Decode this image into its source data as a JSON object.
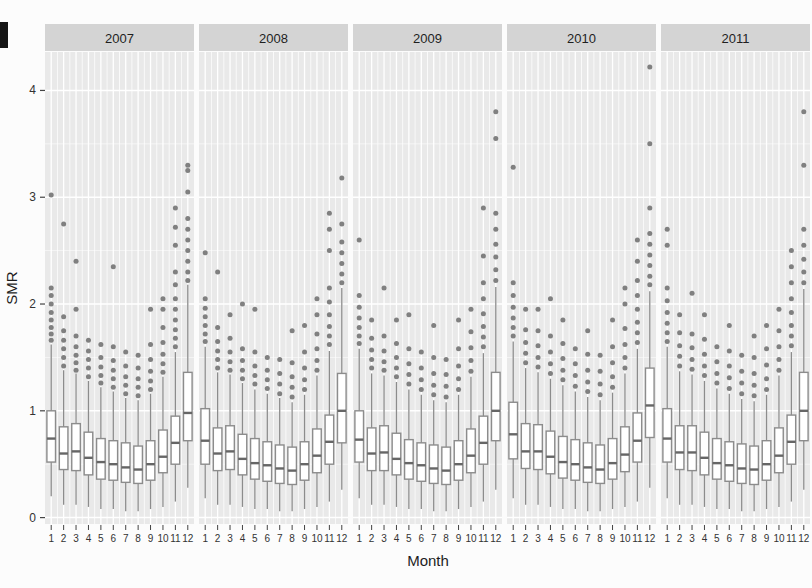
{
  "chart_data": {
    "type": "boxplot",
    "title": "",
    "facets": [
      "2007",
      "2008",
      "2009",
      "2010",
      "2011"
    ],
    "xlabel": "Month",
    "ylabel": "SMR",
    "x_categories": [
      "1",
      "2",
      "3",
      "4",
      "5",
      "6",
      "7",
      "8",
      "9",
      "10",
      "11",
      "12"
    ],
    "yticks": [
      0,
      1,
      2,
      3,
      4
    ],
    "ylim": [
      -0.06,
      4.36
    ],
    "legend": "none",
    "grid": "white major and minor gridlines on gray panels",
    "box_value_order": [
      "whisker_low",
      "q1",
      "median",
      "q3",
      "whisker_high",
      "outliers"
    ],
    "panels": [
      {
        "year": "2007",
        "boxes": [
          [
            0.2,
            0.52,
            0.74,
            1.0,
            1.62,
            [
              1.66,
              1.72,
              1.78,
              1.85,
              1.92,
              2.0,
              2.08,
              2.15,
              3.02
            ]
          ],
          [
            0.12,
            0.45,
            0.6,
            0.85,
            1.38,
            [
              1.42,
              1.5,
              1.58,
              1.66,
              1.75,
              1.88,
              2.75
            ]
          ],
          [
            0.12,
            0.44,
            0.62,
            0.88,
            1.35,
            [
              1.38,
              1.45,
              1.52,
              1.6,
              1.7,
              1.95,
              2.4
            ]
          ],
          [
            0.1,
            0.4,
            0.56,
            0.8,
            1.28,
            [
              1.32,
              1.4,
              1.48,
              1.56,
              1.66
            ]
          ],
          [
            0.08,
            0.36,
            0.52,
            0.74,
            1.22,
            [
              1.26,
              1.33,
              1.41,
              1.5,
              1.62
            ]
          ],
          [
            0.08,
            0.35,
            0.5,
            0.72,
            1.18,
            [
              1.22,
              1.3,
              1.38,
              1.47,
              1.6,
              2.35
            ]
          ],
          [
            0.06,
            0.33,
            0.47,
            0.7,
            1.12,
            [
              1.16,
              1.24,
              1.32,
              1.42,
              1.55
            ]
          ],
          [
            0.06,
            0.32,
            0.45,
            0.67,
            1.1,
            [
              1.14,
              1.22,
              1.3,
              1.4,
              1.52
            ]
          ],
          [
            0.08,
            0.35,
            0.5,
            0.72,
            1.16,
            [
              1.2,
              1.28,
              1.37,
              1.48,
              1.62,
              1.95
            ]
          ],
          [
            0.1,
            0.42,
            0.57,
            0.82,
            1.32,
            [
              1.36,
              1.44,
              1.53,
              1.64,
              1.78,
              1.95,
              2.05
            ]
          ],
          [
            0.15,
            0.5,
            0.7,
            0.95,
            1.55,
            [
              1.6,
              1.68,
              1.76,
              1.85,
              1.95,
              2.05,
              2.18,
              2.3,
              2.55,
              2.72,
              2.9
            ]
          ],
          [
            0.28,
            0.72,
            0.98,
            1.36,
            2.18,
            [
              2.22,
              2.3,
              2.4,
              2.5,
              2.6,
              2.7,
              2.8,
              3.05,
              3.25,
              3.3
            ]
          ]
        ]
      },
      {
        "year": "2008",
        "boxes": [
          [
            0.18,
            0.5,
            0.72,
            1.02,
            1.6,
            [
              1.65,
              1.72,
              1.8,
              1.88,
              1.96,
              2.05,
              2.48
            ]
          ],
          [
            0.12,
            0.44,
            0.6,
            0.84,
            1.36,
            [
              1.4,
              1.48,
              1.56,
              1.65,
              1.78,
              2.3
            ]
          ],
          [
            0.12,
            0.45,
            0.62,
            0.86,
            1.34,
            [
              1.38,
              1.46,
              1.55,
              1.68,
              1.9
            ]
          ],
          [
            0.1,
            0.4,
            0.55,
            0.78,
            1.26,
            [
              1.3,
              1.38,
              1.47,
              1.58,
              2.0
            ]
          ],
          [
            0.08,
            0.36,
            0.51,
            0.74,
            1.2,
            [
              1.25,
              1.33,
              1.42,
              1.55,
              1.95
            ]
          ],
          [
            0.08,
            0.34,
            0.49,
            0.71,
            1.16,
            [
              1.21,
              1.29,
              1.38,
              1.5
            ]
          ],
          [
            0.06,
            0.32,
            0.46,
            0.68,
            1.12,
            [
              1.16,
              1.25,
              1.35,
              1.48
            ]
          ],
          [
            0.06,
            0.31,
            0.44,
            0.66,
            1.08,
            [
              1.13,
              1.22,
              1.32,
              1.45,
              1.75
            ]
          ],
          [
            0.08,
            0.35,
            0.5,
            0.71,
            1.15,
            [
              1.2,
              1.29,
              1.4,
              1.55,
              1.8
            ]
          ],
          [
            0.1,
            0.42,
            0.58,
            0.83,
            1.33,
            [
              1.38,
              1.47,
              1.58,
              1.72,
              1.9,
              2.05
            ]
          ],
          [
            0.15,
            0.5,
            0.71,
            0.96,
            1.56,
            [
              1.62,
              1.7,
              1.79,
              1.9,
              2.02,
              2.15,
              2.5,
              2.7,
              2.85
            ]
          ],
          [
            0.26,
            0.7,
            1.0,
            1.35,
            2.15,
            [
              2.2,
              2.28,
              2.38,
              2.48,
              2.58,
              2.75,
              3.18
            ]
          ]
        ]
      },
      {
        "year": "2009",
        "boxes": [
          [
            0.18,
            0.52,
            0.73,
            1.0,
            1.58,
            [
              1.63,
              1.7,
              1.78,
              1.87,
              1.97,
              2.08,
              2.6
            ]
          ],
          [
            0.12,
            0.44,
            0.6,
            0.84,
            1.35,
            [
              1.4,
              1.48,
              1.57,
              1.68,
              1.85
            ]
          ],
          [
            0.12,
            0.44,
            0.61,
            0.86,
            1.33,
            [
              1.38,
              1.46,
              1.56,
              1.7,
              2.15
            ]
          ],
          [
            0.1,
            0.4,
            0.55,
            0.79,
            1.27,
            [
              1.32,
              1.4,
              1.5,
              1.63,
              1.85
            ]
          ],
          [
            0.08,
            0.36,
            0.51,
            0.73,
            1.2,
            [
              1.25,
              1.34,
              1.44,
              1.58,
              1.9
            ]
          ],
          [
            0.08,
            0.34,
            0.49,
            0.7,
            1.15,
            [
              1.2,
              1.29,
              1.4,
              1.55
            ]
          ],
          [
            0.06,
            0.32,
            0.46,
            0.68,
            1.1,
            [
              1.15,
              1.24,
              1.35,
              1.5,
              1.8
            ]
          ],
          [
            0.06,
            0.31,
            0.44,
            0.66,
            1.08,
            [
              1.13,
              1.23,
              1.34,
              1.48
            ]
          ],
          [
            0.08,
            0.35,
            0.5,
            0.72,
            1.15,
            [
              1.2,
              1.3,
              1.42,
              1.58,
              1.85
            ]
          ],
          [
            0.1,
            0.42,
            0.58,
            0.83,
            1.32,
            [
              1.37,
              1.47,
              1.59,
              1.74,
              1.95
            ]
          ],
          [
            0.15,
            0.5,
            0.7,
            0.95,
            1.54,
            [
              1.6,
              1.69,
              1.79,
              1.91,
              2.05,
              2.2,
              2.45,
              2.9
            ]
          ],
          [
            0.26,
            0.72,
            1.0,
            1.36,
            2.16,
            [
              2.22,
              2.32,
              2.44,
              2.56,
              2.7,
              2.85,
              3.55,
              3.8
            ]
          ]
        ]
      },
      {
        "year": "2010",
        "boxes": [
          [
            0.18,
            0.55,
            0.78,
            1.08,
            1.65,
            [
              1.7,
              1.78,
              1.87,
              1.97,
              2.08,
              2.2,
              3.28
            ]
          ],
          [
            0.12,
            0.46,
            0.62,
            0.88,
            1.4,
            [
              1.45,
              1.54,
              1.64,
              1.76,
              1.95
            ]
          ],
          [
            0.12,
            0.45,
            0.62,
            0.87,
            1.36,
            [
              1.41,
              1.5,
              1.61,
              1.75,
              1.95
            ]
          ],
          [
            0.1,
            0.41,
            0.57,
            0.81,
            1.3,
            [
              1.35,
              1.44,
              1.55,
              1.7,
              2.05
            ]
          ],
          [
            0.08,
            0.37,
            0.52,
            0.76,
            1.24,
            [
              1.29,
              1.38,
              1.49,
              1.63,
              1.85
            ]
          ],
          [
            0.08,
            0.35,
            0.5,
            0.73,
            1.18,
            [
              1.23,
              1.33,
              1.44,
              1.58
            ]
          ],
          [
            0.06,
            0.33,
            0.47,
            0.7,
            1.13,
            [
              1.18,
              1.27,
              1.38,
              1.53,
              1.75
            ]
          ],
          [
            0.06,
            0.32,
            0.45,
            0.68,
            1.1,
            [
              1.15,
              1.25,
              1.37,
              1.52
            ]
          ],
          [
            0.08,
            0.36,
            0.51,
            0.74,
            1.17,
            [
              1.22,
              1.32,
              1.45,
              1.6,
              1.85
            ]
          ],
          [
            0.1,
            0.43,
            0.59,
            0.85,
            1.35,
            [
              1.4,
              1.5,
              1.62,
              1.77,
              2.0,
              2.15
            ]
          ],
          [
            0.15,
            0.52,
            0.72,
            0.98,
            1.58,
            [
              1.64,
              1.73,
              1.83,
              1.95,
              2.08,
              2.22,
              2.4,
              2.6
            ]
          ],
          [
            0.28,
            0.75,
            1.05,
            1.4,
            2.12,
            [
              2.18,
              2.26,
              2.36,
              2.46,
              2.56,
              2.66,
              2.9,
              3.5,
              4.22
            ]
          ]
        ]
      },
      {
        "year": "2011",
        "boxes": [
          [
            0.18,
            0.52,
            0.74,
            1.02,
            1.6,
            [
              1.65,
              1.73,
              1.82,
              1.92,
              2.03,
              2.15,
              2.55,
              2.7
            ]
          ],
          [
            0.12,
            0.45,
            0.61,
            0.86,
            1.37,
            [
              1.42,
              1.51,
              1.61,
              1.73,
              1.9
            ]
          ],
          [
            0.12,
            0.44,
            0.61,
            0.86,
            1.34,
            [
              1.39,
              1.48,
              1.59,
              1.72,
              2.1
            ]
          ],
          [
            0.1,
            0.4,
            0.56,
            0.8,
            1.28,
            [
              1.33,
              1.42,
              1.53,
              1.67,
              1.9
            ]
          ],
          [
            0.08,
            0.36,
            0.51,
            0.74,
            1.21,
            [
              1.26,
              1.35,
              1.46,
              1.6
            ]
          ],
          [
            0.08,
            0.34,
            0.49,
            0.71,
            1.16,
            [
              1.21,
              1.31,
              1.42,
              1.56,
              1.8
            ]
          ],
          [
            0.06,
            0.32,
            0.46,
            0.69,
            1.11,
            [
              1.16,
              1.26,
              1.37,
              1.52
            ]
          ],
          [
            0.06,
            0.31,
            0.45,
            0.67,
            1.09,
            [
              1.14,
              1.24,
              1.35,
              1.5,
              1.7
            ]
          ],
          [
            0.08,
            0.35,
            0.5,
            0.72,
            1.15,
            [
              1.2,
              1.3,
              1.43,
              1.58,
              1.8
            ]
          ],
          [
            0.1,
            0.42,
            0.58,
            0.84,
            1.33,
            [
              1.38,
              1.48,
              1.6,
              1.75,
              1.95
            ]
          ],
          [
            0.15,
            0.5,
            0.71,
            0.96,
            1.55,
            [
              1.61,
              1.7,
              1.8,
              1.92,
              2.05,
              2.2,
              2.35,
              2.5
            ]
          ],
          [
            0.26,
            0.72,
            1.0,
            1.36,
            2.14,
            [
              2.2,
              2.3,
              2.42,
              2.55,
              2.7,
              3.3,
              3.8
            ]
          ]
        ]
      }
    ],
    "style": {
      "panel_bg": "#e9e9e9",
      "strip_bg": "#d4d4d4",
      "strip_text": "#1f1f1f",
      "grid_major": "#ffffff",
      "grid_minor": "#f3f3f3",
      "box_fill": "#ffffff",
      "box_stroke": "#8c8c8c",
      "median": "#666666",
      "whisker": "#8c8c8c",
      "outlier": "#6f6f6f",
      "axis_text": "#333333"
    }
  }
}
